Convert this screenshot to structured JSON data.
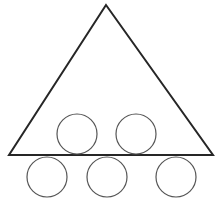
{
  "figure": {
    "canvas": {
      "width": 220,
      "height": 201,
      "background_color": "#ffffff"
    },
    "shapes": {
      "triangle": {
        "name": "triangle",
        "points": "106,5 213,155 9,155",
        "stroke_color": "#262626",
        "stroke_width": 2,
        "fill": "none",
        "vertices": {
          "apex": [
            106,
            5
          ],
          "bottom_right": [
            213,
            155
          ],
          "bottom_left": [
            9,
            155
          ]
        }
      },
      "circles": [
        {
          "name": "circle-upper-left",
          "row": "upper",
          "cx": 77,
          "cy": 134,
          "r": 20,
          "stroke_color": "#555555",
          "stroke_width": 1.2,
          "fill": "none"
        },
        {
          "name": "circle-upper-right",
          "row": "upper",
          "cx": 136,
          "cy": 134,
          "r": 20,
          "stroke_color": "#555555",
          "stroke_width": 1.2,
          "fill": "none"
        },
        {
          "name": "circle-lower-left",
          "row": "lower",
          "cx": 47,
          "cy": 177,
          "r": 20,
          "stroke_color": "#555555",
          "stroke_width": 1.2,
          "fill": "none"
        },
        {
          "name": "circle-lower-middle",
          "row": "lower",
          "cx": 107,
          "cy": 177,
          "r": 20,
          "stroke_color": "#555555",
          "stroke_width": 1.2,
          "fill": "none"
        },
        {
          "name": "circle-lower-right",
          "row": "lower",
          "cx": 176,
          "cy": 177,
          "r": 20,
          "stroke_color": "#555555",
          "stroke_width": 1.2,
          "fill": "none"
        }
      ]
    },
    "counts": {
      "triangles": 1,
      "circles": 5,
      "circles_upper_row": 2,
      "circles_lower_row": 3
    }
  }
}
